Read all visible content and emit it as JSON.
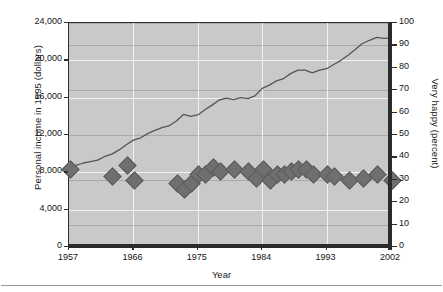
{
  "axes": {
    "xlabel": "Year",
    "ylabel_left": "Personal income in 1995 (dollars)",
    "ylabel_right": "Very happy (percent)",
    "x_ticks": [
      "1957",
      "1966",
      "1975",
      "1984",
      "1993",
      "2002"
    ],
    "y_ticks_left": [
      "0",
      "4,000",
      "8,000",
      "12,000",
      "16,000",
      "20,000",
      "24,000"
    ],
    "y_ticks_right": [
      "0",
      "10",
      "20",
      "30",
      "40",
      "50",
      "60",
      "70",
      "80",
      "90",
      "100"
    ]
  },
  "colors": {
    "plot_background": "#c9c9c9",
    "major_gridline": "#f2f2f2",
    "minor_gridline": "#a9a9a9",
    "line_series": "#555555",
    "marker_series": "#6f6f6f",
    "axis": "#2b2b2b"
  },
  "chart_data": {
    "type": "line",
    "title": "",
    "xlabel": "Year",
    "ylabel": "Personal income in 1995 (dollars)",
    "y2label": "Very happy (percent)",
    "xlim": [
      1957,
      2002
    ],
    "ylim": [
      0,
      24000
    ],
    "y2lim": [
      0,
      100
    ],
    "grid": true,
    "legend": "none",
    "series": [
      {
        "name": "Personal income in 1995 (dollars)",
        "type": "line",
        "axis": "left",
        "x": [
          1957,
          1958,
          1959,
          1960,
          1961,
          1962,
          1963,
          1964,
          1965,
          1966,
          1967,
          1968,
          1969,
          1970,
          1971,
          1972,
          1973,
          1974,
          1975,
          1976,
          1977,
          1978,
          1979,
          1980,
          1981,
          1982,
          1983,
          1984,
          1985,
          1986,
          1987,
          1988,
          1989,
          1990,
          1991,
          1992,
          1993,
          1994,
          1995,
          1996,
          1997,
          1998,
          1999,
          2000,
          2001,
          2002
        ],
        "y": [
          8800,
          8750,
          9000,
          9150,
          9300,
          9700,
          9950,
          10400,
          10950,
          11450,
          11700,
          12150,
          12500,
          12800,
          13000,
          13500,
          14200,
          14000,
          14150,
          14700,
          15200,
          15750,
          15950,
          15800,
          16000,
          15900,
          16200,
          17000,
          17350,
          17800,
          18050,
          18600,
          18950,
          18950,
          18650,
          18950,
          19100,
          19550,
          20000,
          20550,
          21150,
          21800,
          22150,
          22450,
          22350,
          22400
        ]
      },
      {
        "name": "Very happy (percent)",
        "type": "scatter",
        "marker": "diamond",
        "axis": "right",
        "x": [
          1957,
          1963,
          1965,
          1966,
          1972,
          1973,
          1974,
          1975,
          1976,
          1977,
          1978,
          1980,
          1982,
          1983,
          1984,
          1985,
          1986,
          1987,
          1988,
          1989,
          1990,
          1991,
          1993,
          1994,
          1996,
          1998,
          2000,
          2002
        ],
        "y": [
          35,
          32,
          37,
          30,
          29,
          26,
          29,
          33,
          33,
          36,
          34,
          35,
          34,
          31,
          35,
          30,
          33,
          33,
          34,
          35,
          35,
          33,
          33,
          32,
          30,
          31,
          33,
          30
        ]
      }
    ]
  }
}
